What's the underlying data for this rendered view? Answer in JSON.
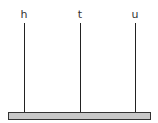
{
  "diagram": {
    "type": "tree",
    "labels": [
      {
        "text": "h",
        "x": 24
      },
      {
        "text": "t",
        "x": 80
      },
      {
        "text": "u",
        "x": 135
      }
    ],
    "base_bar": {
      "fill": "#c8c8c8",
      "stroke": "#333333"
    }
  }
}
